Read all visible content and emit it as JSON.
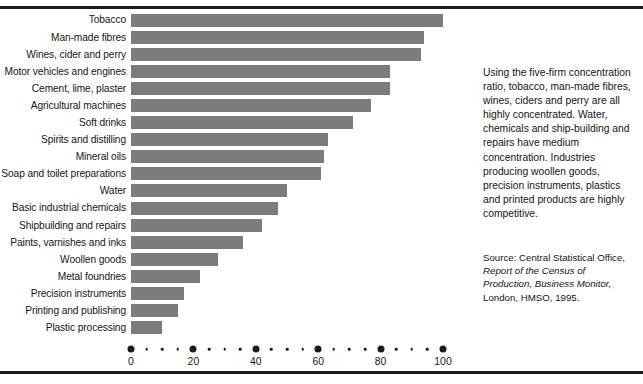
{
  "chart_data": {
    "type": "bar",
    "orientation": "horizontal",
    "title": "",
    "xlabel": "",
    "ylabel": "",
    "xlim": [
      0,
      100
    ],
    "grid": false,
    "legend": null,
    "bar_color": "#7c7c7c",
    "axis_major_ticks": [
      0,
      20,
      40,
      60,
      80,
      100
    ],
    "axis_minor_step": 5,
    "tick_labels": [
      "0",
      "20",
      "40",
      "60",
      "80",
      "100"
    ],
    "categories": [
      "Tobacco",
      "Man-made fibres",
      "Wines, cider and perry",
      "Motor vehicles and engines",
      "Cement, lime, plaster",
      "Agricultural machines",
      "Soft drinks",
      "Spirits and distilling",
      "Mineral oils",
      "Soap and toilet preparations",
      "Water",
      "Basic industrial chemicals",
      "Shipbuilding and repairs",
      "Paints, varnishes and inks",
      "Woollen goods",
      "Metal foundries",
      "Precision instruments",
      "Printing and publishing",
      "Plastic processing"
    ],
    "values": [
      100,
      94,
      93,
      83,
      83,
      77,
      71,
      63,
      62,
      61,
      50,
      47,
      42,
      36,
      28,
      22,
      17,
      15,
      10
    ]
  },
  "side": {
    "note": "Using the five-firm concentration ratio, tobacco, man-made fibres, wines, ciders and perry are all highly concentrated. Water, chemicals and ship-building and repairs have medium concentration. Industries producing woollen goods, precision instruments, plastics and printed products are highly competitive.",
    "source_prefix": "Source: Central Statistical Office,",
    "source_italic": "Report of the Census of Production, Business Monitor,",
    "source_suffix": "London, HMSO, 1995."
  }
}
